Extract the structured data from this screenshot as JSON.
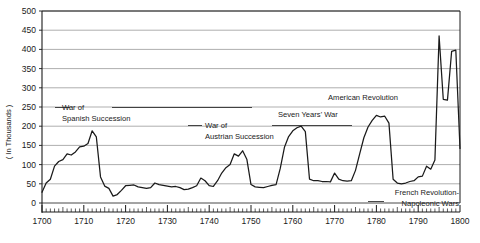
{
  "chart_data": {
    "type": "line",
    "title": "",
    "subtitle": "",
    "xlabel": "",
    "ylabel": "( In Thousands )",
    "xlim": [
      1700,
      1800
    ],
    "ylim": [
      0,
      500
    ],
    "grid": true,
    "legend_position": "none",
    "y_ticks": [
      0,
      50,
      100,
      150,
      200,
      250,
      300,
      350,
      400,
      450,
      500
    ],
    "y_tick_labels": [
      "0",
      "50",
      "100",
      "150",
      "200",
      "250",
      "300",
      "350",
      "400",
      "450",
      "500"
    ],
    "x_ticks": [
      1700,
      1710,
      1720,
      1730,
      1740,
      1750,
      1760,
      1770,
      1780,
      1790,
      1800
    ],
    "x_tick_labels": [
      "1700",
      "1710",
      "1720",
      "1730",
      "1740",
      "1750",
      "1760",
      "1770",
      "1780",
      "1790",
      "1800"
    ],
    "x_minor_tick_step": 1,
    "series": [
      {
        "name": "Armed forces strength",
        "color": "#1a1a1a",
        "x": [
          1700,
          1701,
          1702,
          1703,
          1704,
          1705,
          1706,
          1707,
          1708,
          1709,
          1710,
          1711,
          1712,
          1713,
          1714,
          1715,
          1716,
          1717,
          1718,
          1719,
          1720,
          1721,
          1722,
          1723,
          1724,
          1725,
          1726,
          1727,
          1728,
          1729,
          1730,
          1731,
          1732,
          1733,
          1734,
          1735,
          1736,
          1737,
          1738,
          1739,
          1740,
          1741,
          1742,
          1743,
          1744,
          1745,
          1746,
          1747,
          1748,
          1749,
          1750,
          1751,
          1752,
          1753,
          1754,
          1755,
          1756,
          1757,
          1758,
          1759,
          1760,
          1761,
          1762,
          1763,
          1764,
          1765,
          1766,
          1767,
          1768,
          1769,
          1770,
          1771,
          1772,
          1773,
          1774,
          1775,
          1776,
          1777,
          1778,
          1779,
          1780,
          1781,
          1782,
          1783,
          1784,
          1785,
          1786,
          1787,
          1788,
          1789,
          1790,
          1791,
          1792,
          1793,
          1794,
          1795,
          1796,
          1797,
          1798,
          1799,
          1800
        ],
        "values": [
          28,
          52,
          62,
          96,
          108,
          113,
          128,
          125,
          133,
          146,
          148,
          155,
          188,
          172,
          68,
          44,
          38,
          18,
          22,
          33,
          45,
          46,
          47,
          42,
          40,
          38,
          40,
          52,
          48,
          46,
          44,
          42,
          43,
          40,
          35,
          36,
          40,
          45,
          65,
          58,
          45,
          43,
          58,
          78,
          92,
          100,
          128,
          122,
          136,
          114,
          48,
          42,
          41,
          40,
          43,
          46,
          48,
          90,
          145,
          173,
          188,
          196,
          200,
          186,
          62,
          58,
          58,
          56,
          56,
          55,
          78,
          62,
          58,
          57,
          58,
          85,
          128,
          170,
          198,
          215,
          228,
          224,
          226,
          208,
          62,
          52,
          50,
          52,
          56,
          58,
          68,
          70,
          96,
          88,
          112,
          435,
          270,
          268,
          395,
          398,
          142
        ]
      }
    ],
    "annotations": [
      {
        "id": "war-of-spanish-succession",
        "lines": [
          "War of",
          "Spanish Succession"
        ],
        "x_start": 1702,
        "x_end": 1713
      },
      {
        "id": "war-of-austrian-succession",
        "lines": [
          "War of",
          "Austrian Succession"
        ],
        "x_start": 1739,
        "x_end": 1748
      },
      {
        "id": "seven-years-war",
        "lines": [
          "Seven Years' War"
        ],
        "x_start": 1756,
        "x_end": 1763
      },
      {
        "id": "american-revolution",
        "lines": [
          "American Revolution"
        ],
        "x_start": 1775,
        "x_end": 1783
      },
      {
        "id": "french-revolution-napoleonic-wars",
        "lines": [
          "French Revolution-",
          "Napoleonic Wars"
        ],
        "x_start": 1793,
        "x_end": 1800
      }
    ],
    "colors": {
      "line": "#1a1a1a",
      "grid": "#8c8c8c",
      "axis": "#1a1a1a",
      "background": "#ffffff",
      "text": "#1a1a1a"
    }
  }
}
